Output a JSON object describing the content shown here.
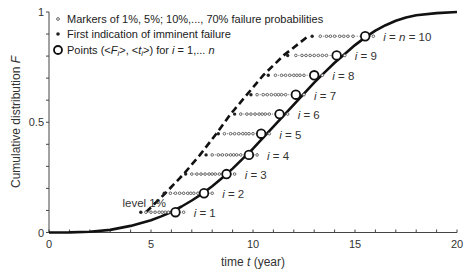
{
  "chart_data": {
    "type": "line",
    "title": "",
    "xlabel": "time t (year)",
    "xlabel_parts": {
      "prefix": "time ",
      "var": "t",
      "suffix": " (year)"
    },
    "ylabel": "Cumulative distribution F",
    "ylabel_parts": {
      "prefix": "Cumulative distribution ",
      "var": "F"
    },
    "xlim": [
      0,
      20
    ],
    "ylim": [
      0,
      1
    ],
    "x_ticks_major": [
      0,
      5,
      10,
      15,
      20
    ],
    "x_tick_labels": [
      "0",
      "5",
      "10",
      "15",
      "20"
    ],
    "x_ticks_minor_step": 1,
    "y_ticks_major": [
      0,
      0.5,
      1
    ],
    "y_tick_labels": [
      "0",
      "0.5",
      "1"
    ],
    "y_ticks_minor_step": 0.1,
    "grid": false,
    "legend_position": "upper-left",
    "legend": [
      {
        "marker": "small-open-dot",
        "text": "Markers of 1%, 5%; 10%,..., 70% failure probabilities"
      },
      {
        "marker": "filled-dot",
        "text": "First indication of imminent failure"
      },
      {
        "marker": "open-circle",
        "text": "Points (<F_i>, <t_i>) for i = 1,... n",
        "parts": [
          "Points (<",
          "F",
          "i",
          ">, <",
          "t",
          "i",
          ">) for ",
          "i",
          " = 1,... ",
          "n"
        ]
      }
    ],
    "annotations": [
      {
        "text": "level 1%",
        "x": 3.6,
        "y": 0.135
      }
    ],
    "series": [
      {
        "name": "Cumulative distribution F(t)",
        "style": "solid-thick",
        "x": [
          0,
          1,
          2,
          3,
          4,
          5,
          5.5,
          6,
          6.5,
          7,
          7.5,
          8,
          8.5,
          9,
          9.5,
          10,
          10.5,
          11,
          11.5,
          12,
          12.5,
          13,
          13.5,
          14,
          14.5,
          15,
          15.5,
          16,
          16.5,
          17,
          17.5,
          18,
          19,
          20
        ],
        "y": [
          0,
          0.0005,
          0.003,
          0.012,
          0.03,
          0.056,
          0.073,
          0.093,
          0.118,
          0.145,
          0.175,
          0.21,
          0.248,
          0.29,
          0.335,
          0.38,
          0.43,
          0.48,
          0.53,
          0.58,
          0.63,
          0.68,
          0.725,
          0.77,
          0.81,
          0.85,
          0.885,
          0.915,
          0.94,
          0.96,
          0.975,
          0.985,
          0.995,
          1.0
        ]
      },
      {
        "name": "Level 1% (dashed)",
        "style": "dashed-thick",
        "x": [
          4.75,
          5.7,
          6.6,
          7.4,
          8.2,
          8.9,
          9.7,
          10.5,
          11.5,
          12.7
        ],
        "y": [
          0.092,
          0.178,
          0.265,
          0.352,
          0.448,
          0.537,
          0.625,
          0.713,
          0.803,
          0.89
        ]
      }
    ],
    "points": [
      {
        "label": "i = 1",
        "i": 1,
        "t": 6.2,
        "F": 0.092,
        "first_indication_t": 4.5,
        "marker_t": [
          4.75,
          5.0,
          5.2,
          5.4,
          5.55,
          5.7,
          5.85,
          6.0,
          6.6
        ]
      },
      {
        "label": "i = 2",
        "i": 2,
        "t": 7.6,
        "F": 0.178,
        "first_indication_t": 5.65,
        "marker_t": [
          5.95,
          6.2,
          6.4,
          6.6,
          6.8,
          6.95,
          7.1,
          7.3,
          8.0
        ]
      },
      {
        "label": "i = 3",
        "i": 3,
        "t": 8.7,
        "F": 0.265,
        "first_indication_t": 6.7,
        "marker_t": [
          7.0,
          7.25,
          7.45,
          7.65,
          7.85,
          8.0,
          8.15,
          8.35,
          9.1
        ]
      },
      {
        "label": "i = 4",
        "i": 4,
        "t": 9.8,
        "F": 0.352,
        "first_indication_t": 7.7,
        "marker_t": [
          8.0,
          8.3,
          8.5,
          8.7,
          8.9,
          9.05,
          9.2,
          9.4,
          10.2
        ]
      },
      {
        "label": "i = 5",
        "i": 5,
        "t": 10.4,
        "F": 0.448,
        "first_indication_t": 8.3,
        "marker_t": [
          8.6,
          8.9,
          9.1,
          9.3,
          9.5,
          9.65,
          9.8,
          10.0,
          10.8
        ]
      },
      {
        "label": "i = 6",
        "i": 6,
        "t": 11.3,
        "F": 0.537,
        "first_indication_t": 9.1,
        "marker_t": [
          9.4,
          9.7,
          9.9,
          10.1,
          10.3,
          10.45,
          10.6,
          10.8,
          11.7
        ]
      },
      {
        "label": "i = 7",
        "i": 7,
        "t": 12.1,
        "F": 0.625,
        "first_indication_t": 9.9,
        "marker_t": [
          10.2,
          10.5,
          10.7,
          10.9,
          11.1,
          11.25,
          11.4,
          11.6,
          12.5
        ]
      },
      {
        "label": "i = 8",
        "i": 8,
        "t": 13.0,
        "F": 0.713,
        "first_indication_t": 10.75,
        "marker_t": [
          11.1,
          11.4,
          11.6,
          11.8,
          12.0,
          12.15,
          12.3,
          12.5,
          13.4
        ]
      },
      {
        "label": "i = 9",
        "i": 9,
        "t": 14.1,
        "F": 0.803,
        "first_indication_t": 11.7,
        "marker_t": [
          12.1,
          12.4,
          12.6,
          12.8,
          13.0,
          13.2,
          13.4,
          13.6,
          14.5
        ]
      },
      {
        "label": "i = n = 10",
        "i": 10,
        "t": 15.5,
        "F": 0.89,
        "first_indication_t": 12.9,
        "marker_t": [
          13.3,
          13.6,
          13.8,
          14.0,
          14.25,
          14.45,
          14.65,
          14.9,
          15.9
        ]
      }
    ]
  },
  "layout": {
    "plot_left": 49,
    "plot_right": 457,
    "plot_top": 12,
    "plot_bottom": 232.5
  },
  "colors": {
    "axis": "#444444",
    "curve": "#111111",
    "marker": "#555555",
    "text": "#333333",
    "background": "#ffffff"
  }
}
